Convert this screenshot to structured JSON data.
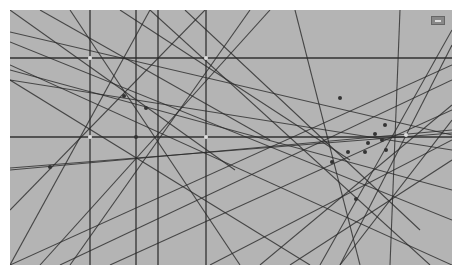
{
  "canvas": {
    "background": "#b4b4b4",
    "line_color": "#2a2a2a",
    "width": 442,
    "height": 255
  },
  "lines": [
    {
      "x1": 80,
      "y1": 0,
      "x2": 80,
      "y2": 255
    },
    {
      "x1": 126,
      "y1": 0,
      "x2": 126,
      "y2": 255
    },
    {
      "x1": 148,
      "y1": 0,
      "x2": 148,
      "y2": 255
    },
    {
      "x1": 196,
      "y1": 0,
      "x2": 196,
      "y2": 255
    },
    {
      "x1": 0,
      "y1": 48,
      "x2": 442,
      "y2": 48
    },
    {
      "x1": 0,
      "y1": 127,
      "x2": 442,
      "y2": 127
    },
    {
      "x1": 0,
      "y1": 0,
      "x2": 225,
      "y2": 160
    },
    {
      "x1": 30,
      "y1": 0,
      "x2": 260,
      "y2": 130
    },
    {
      "x1": 0,
      "y1": 22,
      "x2": 442,
      "y2": 125
    },
    {
      "x1": 0,
      "y1": 32,
      "x2": 442,
      "y2": 210
    },
    {
      "x1": 0,
      "y1": 55,
      "x2": 442,
      "y2": 255
    },
    {
      "x1": 0,
      "y1": 70,
      "x2": 300,
      "y2": 255
    },
    {
      "x1": 110,
      "y1": 0,
      "x2": 340,
      "y2": 150
    },
    {
      "x1": 0,
      "y1": 200,
      "x2": 195,
      "y2": 0
    },
    {
      "x1": 30,
      "y1": 255,
      "x2": 260,
      "y2": 0
    },
    {
      "x1": 60,
      "y1": 0,
      "x2": 230,
      "y2": 255
    },
    {
      "x1": 0,
      "y1": 255,
      "x2": 140,
      "y2": 0
    },
    {
      "x1": 60,
      "y1": 255,
      "x2": 240,
      "y2": 0
    },
    {
      "x1": 0,
      "y1": 160,
      "x2": 442,
      "y2": 120
    },
    {
      "x1": 0,
      "y1": 158,
      "x2": 442,
      "y2": 123
    },
    {
      "x1": 0,
      "y1": 70,
      "x2": 442,
      "y2": 140
    },
    {
      "x1": 140,
      "y1": 0,
      "x2": 420,
      "y2": 255
    },
    {
      "x1": 175,
      "y1": 0,
      "x2": 410,
      "y2": 220
    },
    {
      "x1": 285,
      "y1": 0,
      "x2": 350,
      "y2": 255
    },
    {
      "x1": 390,
      "y1": 0,
      "x2": 380,
      "y2": 255
    },
    {
      "x1": 442,
      "y1": 35,
      "x2": 330,
      "y2": 255
    },
    {
      "x1": 442,
      "y1": 20,
      "x2": 310,
      "y2": 255
    },
    {
      "x1": 442,
      "y1": 55,
      "x2": 0,
      "y2": 255
    },
    {
      "x1": 442,
      "y1": 70,
      "x2": 50,
      "y2": 255
    },
    {
      "x1": 442,
      "y1": 100,
      "x2": 100,
      "y2": 255
    },
    {
      "x1": 442,
      "y1": 130,
      "x2": 200,
      "y2": 255
    },
    {
      "x1": 442,
      "y1": 150,
      "x2": 280,
      "y2": 255
    },
    {
      "x1": 250,
      "y1": 255,
      "x2": 442,
      "y2": 95
    },
    {
      "x1": 330,
      "y1": 255,
      "x2": 442,
      "y2": 110
    },
    {
      "x1": 0,
      "y1": 60,
      "x2": 442,
      "y2": 180
    }
  ],
  "points": [
    {
      "x": 80,
      "y": 48,
      "c": "#dddddd"
    },
    {
      "x": 196,
      "y": 48,
      "c": "#dddddd"
    },
    {
      "x": 80,
      "y": 127,
      "c": "#dddddd"
    },
    {
      "x": 126,
      "y": 127,
      "c": "#333333"
    },
    {
      "x": 196,
      "y": 127,
      "c": "#dddddd"
    },
    {
      "x": 114,
      "y": 86,
      "c": "#333333"
    },
    {
      "x": 136,
      "y": 98,
      "c": "#333333"
    },
    {
      "x": 40,
      "y": 157,
      "c": "#333333"
    },
    {
      "x": 330,
      "y": 88,
      "c": "#333333"
    },
    {
      "x": 375,
      "y": 115,
      "c": "#333333"
    },
    {
      "x": 365,
      "y": 124,
      "c": "#333333"
    },
    {
      "x": 358,
      "y": 133,
      "c": "#333333"
    },
    {
      "x": 372,
      "y": 130,
      "c": "#333333"
    },
    {
      "x": 355,
      "y": 142,
      "c": "#333333"
    },
    {
      "x": 376,
      "y": 140,
      "c": "#333333"
    },
    {
      "x": 338,
      "y": 142,
      "c": "#333333"
    },
    {
      "x": 322,
      "y": 152,
      "c": "#333333"
    },
    {
      "x": 346,
      "y": 189,
      "c": "#333333"
    },
    {
      "x": 396,
      "y": 125,
      "c": "#dddddd"
    }
  ],
  "corner_button": {
    "icon": "window-restore-icon"
  }
}
